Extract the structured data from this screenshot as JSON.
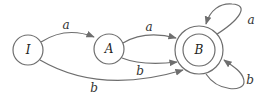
{
  "diagram": {
    "type": "finite-automaton",
    "states": [
      {
        "id": "I",
        "label": "I",
        "accepting": false
      },
      {
        "id": "A",
        "label": "A",
        "accepting": false
      },
      {
        "id": "B",
        "label": "B",
        "accepting": true
      }
    ],
    "transitions": [
      {
        "from": "I",
        "to": "A",
        "label": "a"
      },
      {
        "from": "A",
        "to": "B",
        "label": "a"
      },
      {
        "from": "A",
        "to": "B",
        "label": "b"
      },
      {
        "from": "I",
        "to": "B",
        "label": "b"
      },
      {
        "from": "B",
        "to": "B",
        "label": "a"
      },
      {
        "from": "B",
        "to": "B",
        "label": "b"
      }
    ],
    "colors": {
      "stroke": "#6e6e6e",
      "text": "#333333"
    }
  }
}
